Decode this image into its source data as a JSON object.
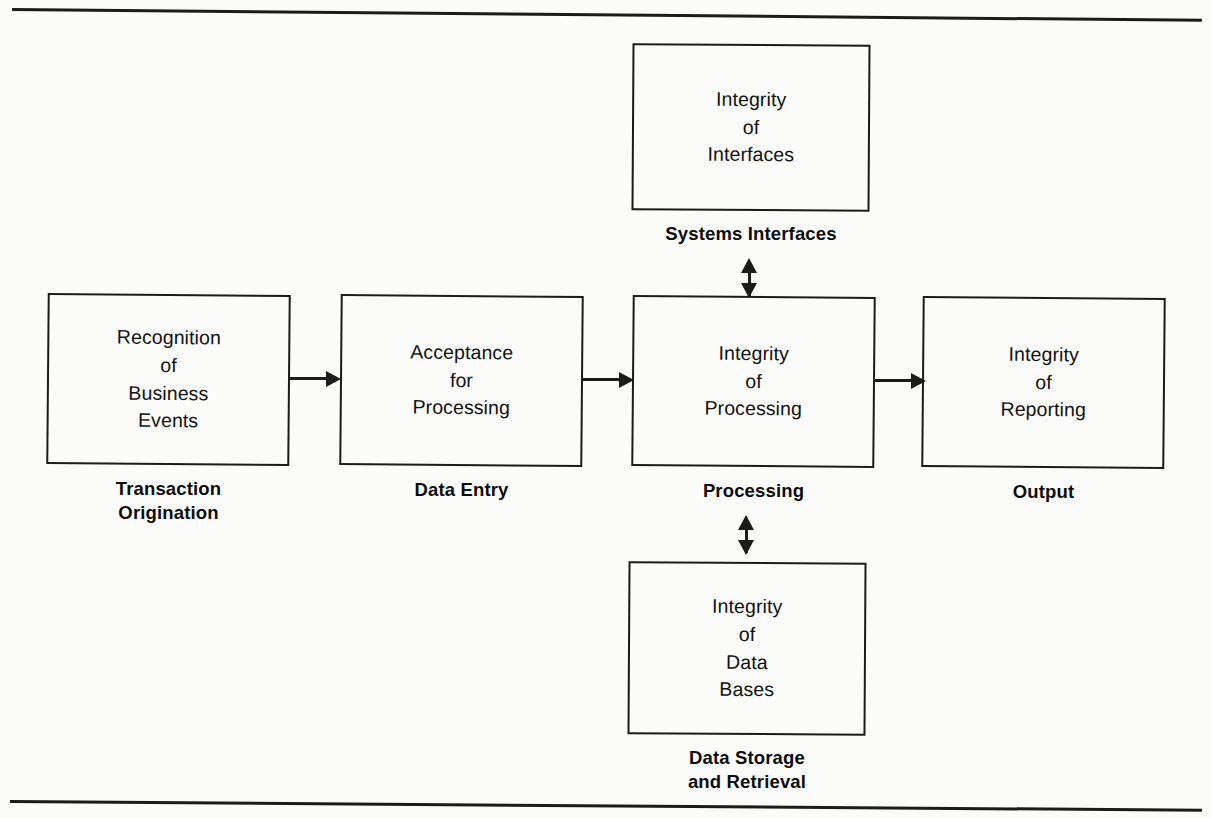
{
  "figure": {
    "top_rule": "",
    "bottom_rule": "",
    "background_color": "#fbfbf9",
    "line_color": "#1b1b1b"
  },
  "nodes": {
    "transaction_origination": {
      "body": "Recognition\nof\nBusiness\nEvents",
      "caption": "Transaction\nOrigination"
    },
    "data_entry": {
      "body": "Acceptance\nfor\nProcessing",
      "caption": "Data Entry"
    },
    "processing": {
      "body": "Integrity\nof\nProcessing",
      "caption": "Processing"
    },
    "output": {
      "body": "Integrity\nof\nReporting",
      "caption": "Output"
    },
    "systems_interfaces": {
      "body": "Integrity\nof\nInterfaces",
      "caption": "Systems Interfaces"
    },
    "data_storage": {
      "body": "Integrity\nof\nData\nBases",
      "caption": "Data Storage\nand Retrieval"
    }
  },
  "connectors": [
    {
      "id": "origination-to-entry",
      "kind": "arrow-right"
    },
    {
      "id": "entry-to-processing",
      "kind": "arrow-right"
    },
    {
      "id": "processing-to-output",
      "kind": "arrow-right"
    },
    {
      "id": "interfaces-to-processing",
      "kind": "double-arrow-vertical"
    },
    {
      "id": "storage-to-processing",
      "kind": "double-arrow-vertical"
    }
  ]
}
